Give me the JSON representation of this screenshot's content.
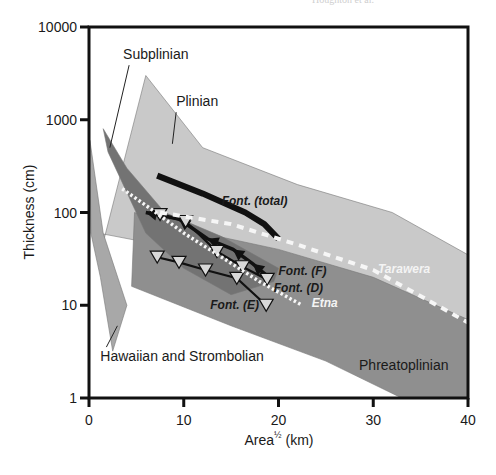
{
  "header_note": "Houghton et al.",
  "chart_data": {
    "type": "line",
    "title": "",
    "xlabel": "Area½ (km)",
    "xlabel_base": "Area",
    "xlabel_sup": "½",
    "xlabel_unit": " (km)",
    "ylabel": "Thickness (cm)",
    "xlim": [
      0,
      40
    ],
    "ylim": [
      1,
      10000
    ],
    "yscale": "log",
    "grid": false,
    "x_ticks": [
      0,
      10,
      20,
      30,
      40
    ],
    "x_tick_labels": [
      "0",
      "10",
      "20",
      "30",
      "40"
    ],
    "y_ticks": [
      1,
      10,
      100,
      1000,
      10000
    ],
    "y_tick_labels": [
      "1",
      "10",
      "100",
      "1000",
      "10000"
    ],
    "regions": [
      {
        "name": "Plinian",
        "color": "#c9c9c9",
        "polygon": [
          [
            1,
            30
          ],
          [
            6,
            3000
          ],
          [
            12,
            500
          ],
          [
            22,
            200
          ],
          [
            32,
            100
          ],
          [
            40,
            35
          ],
          [
            40,
            6
          ],
          [
            30,
            10
          ],
          [
            20,
            30
          ],
          [
            10,
            40
          ],
          [
            1,
            60
          ]
        ]
      },
      {
        "name": "Phreatoplinian",
        "color": "#8f8f8f",
        "polygon": [
          [
            4.8,
            100
          ],
          [
            12,
            60
          ],
          [
            20,
            40
          ],
          [
            30,
            20
          ],
          [
            40,
            7
          ],
          [
            40,
            1
          ],
          [
            33,
            1
          ],
          [
            25,
            2.5
          ],
          [
            15,
            6
          ],
          [
            4.5,
            16
          ]
        ]
      },
      {
        "name": "Subplinian",
        "color": "#737373",
        "polygon": [
          [
            1.5,
            800
          ],
          [
            4,
            300
          ],
          [
            8,
            100
          ],
          [
            14,
            55
          ],
          [
            20,
            25
          ],
          [
            19.5,
            18
          ],
          [
            15,
            13
          ],
          [
            10,
            25
          ],
          [
            6,
            60
          ],
          [
            2,
            450
          ]
        ]
      },
      {
        "name": "Hawaiian and Strombolian",
        "color": "#a8a8a8",
        "polygon": [
          [
            0.1,
            600
          ],
          [
            1.5,
            60
          ],
          [
            4,
            10
          ],
          [
            2.5,
            3.2
          ],
          [
            1.2,
            20
          ],
          [
            0.2,
            60
          ]
        ]
      }
    ],
    "region_labels": [
      {
        "text": "Subplinian",
        "x": 3.6,
        "y": 4500,
        "leader_to": [
          2.2,
          500
        ]
      },
      {
        "text": "Plinian",
        "x": 9.2,
        "y": 1400,
        "leader_to": [
          8.8,
          550
        ]
      },
      {
        "text": "Hawaiian and Strombolian",
        "x": 1.2,
        "y": 2.5,
        "leader_to": [
          3.0,
          6.0
        ]
      },
      {
        "text": "Phreatoplinian",
        "x": 28.5,
        "y": 2.0
      }
    ],
    "series": [
      {
        "name": "Font. (total)",
        "style": "solid-black-thick",
        "x": [
          7.2,
          12,
          16.5,
          18.5,
          20
        ],
        "y": [
          250,
          160,
          100,
          75,
          52
        ],
        "label_pos": [
          14,
          120
        ]
      },
      {
        "name": "Font. (F)",
        "style": "black-line-filled-arrows",
        "x": [
          6.0,
          9.5,
          12.5,
          15.2,
          17.3,
          19.0
        ],
        "y": [
          100,
          85,
          52,
          40,
          28,
          20
        ],
        "label_pos": [
          20.0,
          21
        ]
      },
      {
        "name": "Font. (D)",
        "style": "black-line-open-triangles",
        "x": [
          7.5,
          10.2,
          13.5,
          16.2,
          18.8
        ],
        "y": [
          95,
          80,
          38,
          26,
          19
        ],
        "label_pos": [
          19.5,
          14
        ]
      },
      {
        "name": "Font. (E)",
        "style": "black-line-open-triangles",
        "x": [
          7.2,
          9.5,
          12.3,
          15.6,
          18.7
        ],
        "y": [
          33,
          29,
          24,
          19.5,
          10
        ],
        "label_pos": [
          12.8,
          9
        ]
      },
      {
        "name": "Etna",
        "style": "white-dotted",
        "x": [
          3.5,
          6.5,
          10,
          14,
          18,
          22.5
        ],
        "y": [
          180,
          110,
          60,
          33,
          18,
          10
        ],
        "label_pos": [
          23.5,
          9.5
        ]
      },
      {
        "name": "Tarawera",
        "style": "white-dashed",
        "x": [
          7.5,
          15,
          22,
          30,
          36,
          40
        ],
        "y": [
          100,
          75,
          45,
          24,
          11,
          6.5
        ],
        "label_pos": [
          30.5,
          22
        ]
      }
    ]
  }
}
